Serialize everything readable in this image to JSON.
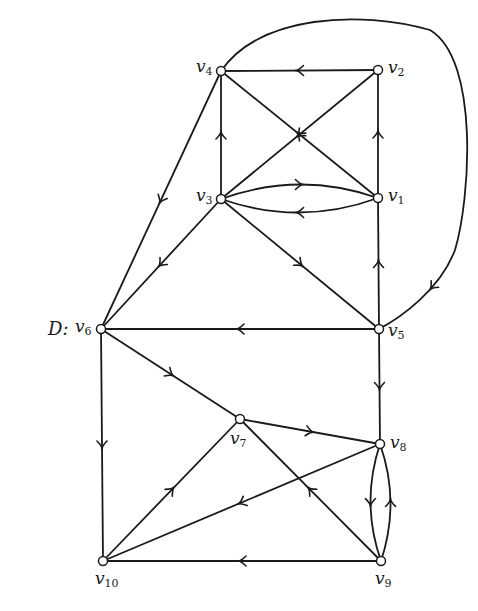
{
  "graph": {
    "title": "D:",
    "title_pos": [
      48,
      318
    ],
    "nodes": [
      {
        "id": "v1",
        "name": "v",
        "sub": "1",
        "x": 378,
        "y": 198,
        "label_pos": [
          388,
          187
        ]
      },
      {
        "id": "v2",
        "name": "v",
        "sub": "2",
        "x": 378,
        "y": 70,
        "label_pos": [
          388,
          59
        ]
      },
      {
        "id": "v3",
        "name": "v",
        "sub": "3",
        "x": 221,
        "y": 199,
        "label_pos": [
          196,
          187
        ]
      },
      {
        "id": "v4",
        "name": "v",
        "sub": "4",
        "x": 221,
        "y": 71,
        "label_pos": [
          196,
          58
        ]
      },
      {
        "id": "v5",
        "name": "v",
        "sub": "5",
        "x": 379,
        "y": 329,
        "label_pos": [
          388,
          322
        ]
      },
      {
        "id": "v6",
        "name": "v",
        "sub": "6",
        "x": 101,
        "y": 329,
        "label_pos": [
          75,
          318
        ]
      },
      {
        "id": "v7",
        "name": "v",
        "sub": "7",
        "x": 240,
        "y": 419,
        "label_pos": [
          230,
          430
        ]
      },
      {
        "id": "v8",
        "name": "v",
        "sub": "8",
        "x": 380,
        "y": 444,
        "label_pos": [
          390,
          434
        ]
      },
      {
        "id": "v9",
        "name": "v",
        "sub": "9",
        "x": 381,
        "y": 561,
        "label_pos": [
          375,
          570
        ]
      },
      {
        "id": "v10",
        "name": "v",
        "sub": "10",
        "x": 103,
        "y": 561,
        "label_pos": [
          95,
          570
        ]
      }
    ],
    "edges": [
      {
        "from": "v2",
        "to": "v4",
        "type": "line"
      },
      {
        "from": "v3",
        "to": "v4",
        "type": "line"
      },
      {
        "from": "v1",
        "to": "v2",
        "type": "line"
      },
      {
        "from": "v1",
        "to": "v4",
        "type": "line"
      },
      {
        "from": "v2",
        "to": "v3",
        "type": "line"
      },
      {
        "from": "v1",
        "to": "v3",
        "type": "arc",
        "bend": -14
      },
      {
        "from": "v3",
        "to": "v1",
        "type": "arc",
        "bend": -14
      },
      {
        "from": "v5",
        "to": "v1",
        "type": "line"
      },
      {
        "from": "v3",
        "to": "v5",
        "type": "line"
      },
      {
        "from": "v3",
        "to": "v6",
        "type": "line"
      },
      {
        "from": "v4",
        "to": "v6",
        "type": "line"
      },
      {
        "from": "v4",
        "to": "v5",
        "type": "path",
        "d": "M221,71 C260,15 360,10 430,30 C480,60 470,200 455,250 C440,290 400,318 379,329",
        "arrow_t": 0.88
      },
      {
        "from": "v5",
        "to": "v6",
        "type": "line"
      },
      {
        "from": "v6",
        "to": "v7",
        "type": "line"
      },
      {
        "from": "v6",
        "to": "v10",
        "type": "line"
      },
      {
        "from": "v5",
        "to": "v8",
        "type": "line"
      },
      {
        "from": "v7",
        "to": "v8",
        "type": "line"
      },
      {
        "from": "v8",
        "to": "v10",
        "type": "line"
      },
      {
        "from": "v10",
        "to": "v7",
        "type": "line"
      },
      {
        "from": "v9",
        "to": "v7",
        "type": "line"
      },
      {
        "from": "v8",
        "to": "v9",
        "type": "arc",
        "bend": 10
      },
      {
        "from": "v9",
        "to": "v8",
        "type": "arc",
        "bend": 10
      },
      {
        "from": "v9",
        "to": "v10",
        "type": "line"
      }
    ]
  }
}
